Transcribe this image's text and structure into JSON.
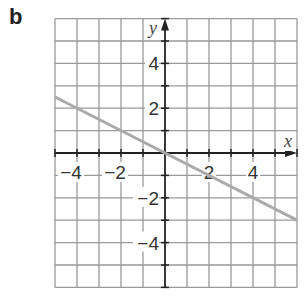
{
  "panel": {
    "label": "b"
  },
  "chart_data": {
    "type": "line",
    "title": "",
    "xlabel": "x",
    "ylabel": "y",
    "xlim": [
      -5,
      6
    ],
    "ylim": [
      -6,
      6
    ],
    "grid": true,
    "grid_step": 1,
    "x_ticks": [
      -4,
      -2,
      2,
      4
    ],
    "x_tick_labels": [
      "−4",
      "−2",
      "2",
      "4"
    ],
    "y_ticks": [
      4,
      2,
      -2,
      -4
    ],
    "y_tick_labels": [
      "4",
      "2",
      "−2",
      "−4"
    ],
    "series": [
      {
        "name": "y = -x/2",
        "equation": "y = -0.5x",
        "x": [
          -5,
          0,
          6
        ],
        "y": [
          2.5,
          0,
          -3
        ],
        "color": "#aaaaaa"
      }
    ],
    "colors": {
      "grid": "#999999",
      "axis": "#222222",
      "line": "#aaaaaa",
      "text": "#333333"
    }
  }
}
